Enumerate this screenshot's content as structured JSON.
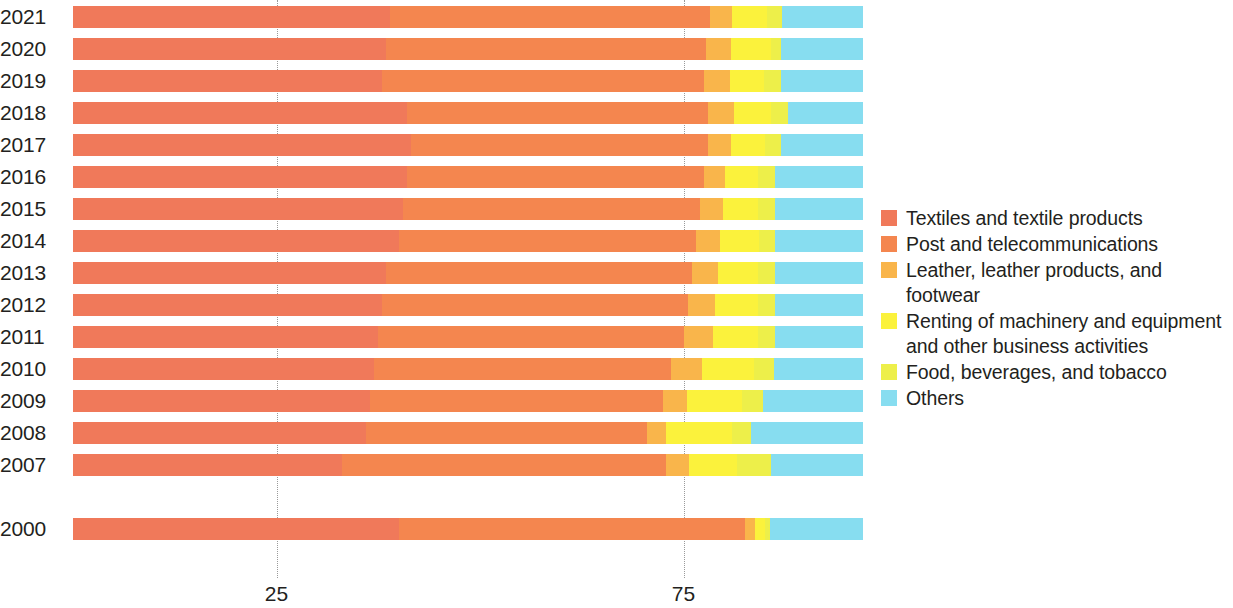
{
  "chart_data": {
    "type": "bar",
    "subtype": "horizontal-stacked",
    "title": "",
    "xlabel": "",
    "ylabel": "",
    "xlim": [
      0,
      100
    ],
    "xticks": [
      25,
      75
    ],
    "xtick_labels": [
      "25",
      "75"
    ],
    "grid": "vertical-dotted",
    "legend_position": "right",
    "categories": [
      "2021",
      "2020",
      "2019",
      "2018",
      "2017",
      "2016",
      "2015",
      "2014",
      "2013",
      "2012",
      "2011",
      "2010",
      "2009",
      "2008",
      "2007",
      "",
      "2000"
    ],
    "series": [
      {
        "name": "Textiles and textile products",
        "color": "#F0795A",
        "values": [
          39.0,
          38.5,
          38.0,
          41.0,
          41.5,
          41.0,
          40.5,
          40.0,
          38.5,
          38.0,
          37.5,
          37.0,
          36.5,
          36.0,
          33.0,
          null,
          40.0
        ]
      },
      {
        "name": "Post and telecommunications",
        "color": "#F4864F",
        "values": [
          39.2,
          39.3,
          39.5,
          37.0,
          36.5,
          36.5,
          36.5,
          36.5,
          37.5,
          37.5,
          37.5,
          36.5,
          36.0,
          34.5,
          39.9,
          null,
          42.6
        ]
      },
      {
        "name": "Leather, leather products, and footwear",
        "color": "#F9B54B",
        "values": [
          2.8,
          3.0,
          3.2,
          3.2,
          2.8,
          2.6,
          2.8,
          3.0,
          3.2,
          3.4,
          3.6,
          3.8,
          2.9,
          2.4,
          2.8,
          null,
          1.2
        ]
      },
      {
        "name": "Renting of machinery and equipment and other business activities",
        "color": "#FBF23C",
        "values": [
          4.3,
          5.0,
          4.2,
          4.6,
          4.2,
          4.0,
          4.4,
          4.8,
          5.0,
          5.2,
          5.6,
          6.4,
          6.8,
          8.0,
          5.9,
          null,
          1.2
        ]
      },
      {
        "name": "Food, beverages, and tobacco",
        "color": "#EDEF4A",
        "values": [
          1.8,
          1.2,
          2.1,
          2.0,
          2.0,
          2.2,
          2.0,
          2.0,
          2.0,
          2.1,
          2.0,
          2.4,
          2.6,
          2.4,
          4.2,
          null,
          0.6
        ]
      },
      {
        "name": "Others",
        "color": "#87DDF0",
        "values": [
          9.9,
          10.0,
          10.0,
          9.2,
          10.0,
          10.7,
          10.8,
          10.7,
          10.8,
          10.8,
          10.8,
          10.9,
          12.2,
          13.7,
          11.2,
          null,
          11.4
        ]
      }
    ]
  },
  "legend": {
    "items": [
      {
        "label": "Textiles and textile products",
        "color": "#F0795A"
      },
      {
        "label": "Post and telecommunications",
        "color": "#F4864F"
      },
      {
        "label": "Leather, leather products, and footwear",
        "color": "#F9B54B"
      },
      {
        "label": "Renting of machinery and equipment\nand other business activities",
        "color": "#FBF23C"
      },
      {
        "label": "Food, beverages, and tobacco",
        "color": "#EDEF4A"
      },
      {
        "label": "Others",
        "color": "#87DDF0"
      }
    ]
  }
}
